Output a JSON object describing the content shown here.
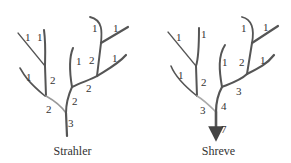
{
  "diagrams": [
    {
      "caption": "Strahler",
      "labels": [
        {
          "text": "1",
          "x": 25,
          "y": 32
        },
        {
          "text": "1",
          "x": 37,
          "y": 32
        },
        {
          "text": "1",
          "x": 26,
          "y": 72
        },
        {
          "text": "2",
          "x": 50,
          "y": 75
        },
        {
          "text": "2",
          "x": 46,
          "y": 104
        },
        {
          "text": "1",
          "x": 76,
          "y": 56
        },
        {
          "text": "2",
          "x": 72,
          "y": 96
        },
        {
          "text": "2",
          "x": 86,
          "y": 83
        },
        {
          "text": "2",
          "x": 89,
          "y": 55
        },
        {
          "text": "1",
          "x": 92,
          "y": 23
        },
        {
          "text": "1",
          "x": 113,
          "y": 23
        },
        {
          "text": "1",
          "x": 112,
          "y": 53
        },
        {
          "text": "3",
          "x": 68,
          "y": 118
        }
      ]
    },
    {
      "caption": "Shreve",
      "labels": [
        {
          "text": "1",
          "x": 30,
          "y": 32
        },
        {
          "text": "1",
          "x": 55,
          "y": 29
        },
        {
          "text": "1",
          "x": 32,
          "y": 70
        },
        {
          "text": "2",
          "x": 55,
          "y": 77
        },
        {
          "text": "3",
          "x": 54,
          "y": 105
        },
        {
          "text": "1",
          "x": 76,
          "y": 57
        },
        {
          "text": "4",
          "x": 75,
          "y": 101
        },
        {
          "text": "3",
          "x": 90,
          "y": 86
        },
        {
          "text": "2",
          "x": 93,
          "y": 57
        },
        {
          "text": "1",
          "x": 95,
          "y": 23
        },
        {
          "text": "1",
          "x": 117,
          "y": 22
        },
        {
          "text": "1",
          "x": 114,
          "y": 55
        },
        {
          "text": "7",
          "x": 75,
          "y": 124
        }
      ]
    }
  ]
}
